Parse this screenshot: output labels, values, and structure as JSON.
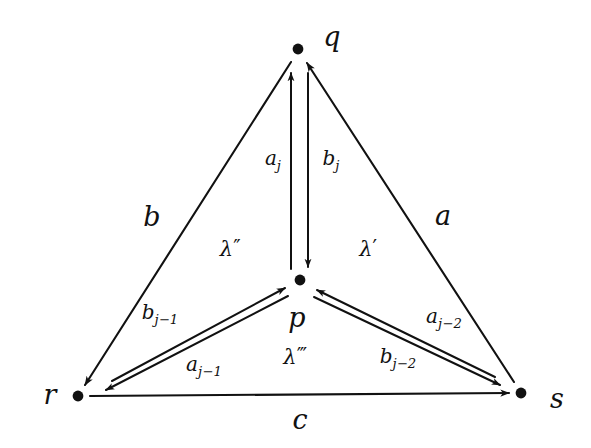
{
  "figure": {
    "kind": "commutative-diagram",
    "background_color": "#ffffff",
    "ink_color": "#111111"
  },
  "vertices": [
    {
      "id": "q",
      "label": "q",
      "x": 298,
      "y": 49,
      "label_x": 332,
      "label_y": 36
    },
    {
      "id": "p",
      "label": "p",
      "x": 300,
      "y": 280,
      "label_x": 297,
      "label_y": 317
    },
    {
      "id": "r",
      "label": "r",
      "x": 78,
      "y": 396,
      "label_x": 50,
      "label_y": 394
    },
    {
      "id": "s",
      "label": "s",
      "x": 521,
      "y": 393,
      "label_x": 557,
      "label_y": 398
    }
  ],
  "outer_edges": [
    {
      "id": "b",
      "label": "b",
      "from": "q",
      "to": "r",
      "label_x": 152,
      "label_y": 216
    },
    {
      "id": "a",
      "label": "a",
      "from": "s",
      "to": "q",
      "label_x": 443,
      "label_y": 215
    },
    {
      "id": "c",
      "label": "c",
      "from": "r",
      "to": "s",
      "label_x": 300,
      "label_y": 419
    }
  ],
  "inner_edges": [
    {
      "id": "a_j",
      "base": "a",
      "subscript": "j",
      "from": "p",
      "to": "q",
      "label_x": 273,
      "label_y": 160
    },
    {
      "id": "b_j",
      "base": "b",
      "subscript": "j",
      "from": "q",
      "to": "p",
      "label_x": 331,
      "label_y": 160
    },
    {
      "id": "b_jm1",
      "base": "b",
      "subscript": "j−1",
      "from": "r",
      "to": "p",
      "label_x": 160,
      "label_y": 314
    },
    {
      "id": "a_jm1",
      "base": "a",
      "subscript": "j−1",
      "from": "p",
      "to": "r",
      "label_x": 204,
      "label_y": 366
    },
    {
      "id": "a_jm2",
      "base": "a",
      "subscript": "j−2",
      "from": "s",
      "to": "p",
      "label_x": 444,
      "label_y": 318
    },
    {
      "id": "b_jm2",
      "base": "b",
      "subscript": "j−2",
      "from": "p",
      "to": "s",
      "label_x": 398,
      "label_y": 358
    }
  ],
  "region_labels": [
    {
      "id": "lambda_double",
      "base": "λ",
      "primes": "″",
      "x": 230,
      "y": 249
    },
    {
      "id": "lambda_single",
      "base": "λ",
      "primes": "′",
      "x": 368,
      "y": 249
    },
    {
      "id": "lambda_triple",
      "base": "λ",
      "primes": "‴",
      "x": 295,
      "y": 357
    }
  ]
}
